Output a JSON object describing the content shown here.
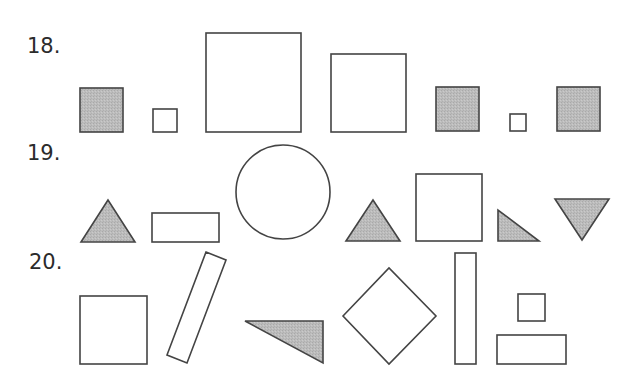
{
  "colors": {
    "stroke": "#444444",
    "fill_gray": "#b9b9b9",
    "fill_white": "#ffffff",
    "label": "#2b2b2b"
  },
  "rows": [
    {
      "label": "18.",
      "shapes": [
        {
          "type": "square",
          "fill": "gray"
        },
        {
          "type": "square",
          "fill": "white",
          "size": "small"
        },
        {
          "type": "square",
          "fill": "white",
          "size": "large"
        },
        {
          "type": "square",
          "fill": "white",
          "size": "medium-large"
        },
        {
          "type": "square",
          "fill": "gray"
        },
        {
          "type": "square",
          "fill": "white",
          "size": "tiny"
        },
        {
          "type": "square",
          "fill": "gray"
        }
      ]
    },
    {
      "label": "19.",
      "shapes": [
        {
          "type": "triangle",
          "fill": "gray"
        },
        {
          "type": "rectangle",
          "fill": "white"
        },
        {
          "type": "circle",
          "fill": "white"
        },
        {
          "type": "triangle",
          "fill": "gray"
        },
        {
          "type": "square",
          "fill": "white"
        },
        {
          "type": "right-triangle",
          "fill": "gray"
        },
        {
          "type": "inverted-triangle",
          "fill": "gray"
        }
      ]
    },
    {
      "label": "20.",
      "shapes": [
        {
          "type": "square",
          "fill": "white"
        },
        {
          "type": "tilted-rectangle",
          "fill": "white"
        },
        {
          "type": "right-triangle",
          "fill": "gray"
        },
        {
          "type": "diamond",
          "fill": "white"
        },
        {
          "type": "tall-rectangle",
          "fill": "white"
        },
        {
          "type": "square",
          "fill": "white",
          "size": "small"
        },
        {
          "type": "rectangle",
          "fill": "white"
        }
      ]
    }
  ]
}
